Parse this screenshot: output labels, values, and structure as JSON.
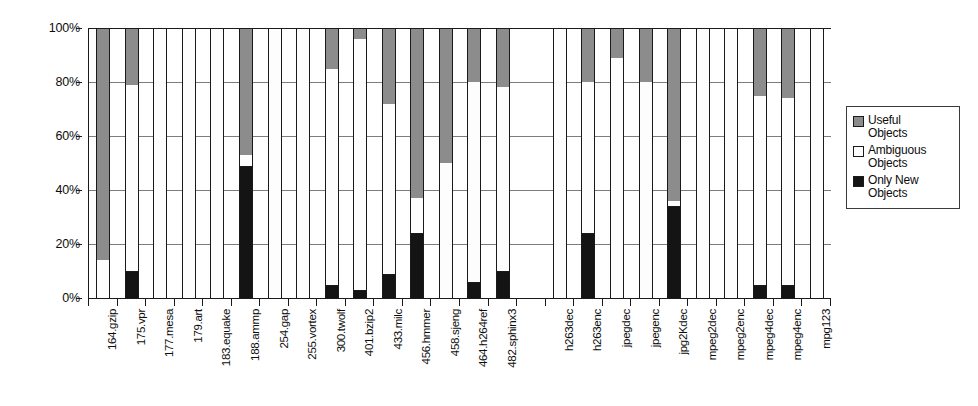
{
  "chart_data": {
    "type": "bar",
    "subtype": "stacked-100-percent",
    "title": "",
    "xlabel": "",
    "ylabel": "",
    "ylim": [
      0,
      100
    ],
    "ytick_labels": [
      "0%",
      "20%",
      "40%",
      "60%",
      "80%",
      "100%"
    ],
    "ytick_values": [
      0,
      20,
      40,
      60,
      80,
      100
    ],
    "grid": true,
    "legend_position": "right",
    "stack_order_bottom_to_top": [
      "Only New Objects",
      "Ambiguous Objects",
      "Useful Objects"
    ],
    "colors": {
      "useful": "#8c8c8c",
      "ambiguous": "#ffffff",
      "only_new": "#141414",
      "axis": "#1a1a1a",
      "gridline": "#7d7d7d"
    },
    "categories": [
      "164.gzip",
      "175.vpr",
      "177.mesa",
      "179.art",
      "183.equake",
      "188.ammp",
      "254.gap",
      "255.vortex",
      "300.twolf",
      "401.bzip2",
      "433.milc",
      "456.hmmer",
      "458.sjeng",
      "464.h264ref",
      "482.sphinx3",
      "",
      "h263dec",
      "h263enc",
      "jpegdec",
      "jpegenc",
      "jpg2Kdec",
      "mpeg2dec",
      "mpeg2enc",
      "mpeg4dec",
      "mpeg4enc",
      "mpg123"
    ],
    "series": [
      {
        "name": "Only New Objects",
        "values": [
          0,
          10,
          0,
          0,
          0,
          49,
          0,
          0,
          5,
          3,
          9,
          24,
          0,
          6,
          10,
          null,
          0,
          24,
          0,
          0,
          34,
          0,
          0,
          5,
          5,
          0
        ]
      },
      {
        "name": "Ambiguous Objects",
        "values": [
          14,
          69,
          100,
          100,
          100,
          4,
          100,
          100,
          80,
          93,
          63,
          13,
          50,
          74,
          68,
          null,
          100,
          56,
          89,
          80,
          2,
          100,
          100,
          70,
          69,
          100
        ]
      },
      {
        "name": "Useful Objects",
        "values": [
          86,
          21,
          0,
          0,
          0,
          47,
          0,
          0,
          15,
          4,
          28,
          63,
          50,
          20,
          22,
          null,
          0,
          20,
          11,
          20,
          64,
          0,
          0,
          25,
          26,
          0
        ]
      }
    ],
    "cumulative_tops": {
      "only_new": [
        0,
        10,
        0,
        0,
        0,
        49,
        0,
        0,
        5,
        3,
        9,
        24,
        0,
        6,
        10,
        null,
        0,
        24,
        0,
        0,
        34,
        0,
        0,
        5,
        5,
        0
      ],
      "ambiguous": [
        14,
        79,
        100,
        100,
        100,
        53,
        100,
        100,
        85,
        96,
        72,
        37,
        50,
        80,
        78,
        null,
        100,
        80,
        89,
        80,
        36,
        100,
        100,
        75,
        74,
        100
      ]
    }
  },
  "legend": {
    "items": [
      {
        "label_line1": "Useful",
        "label_line2": "Objects",
        "swatch": "useful"
      },
      {
        "label_line1": "Ambiguous",
        "label_line2": "Objects",
        "swatch": "ambiguous"
      },
      {
        "label_line1": "Only New",
        "label_line2": "Objects",
        "swatch": "only_new"
      }
    ]
  }
}
